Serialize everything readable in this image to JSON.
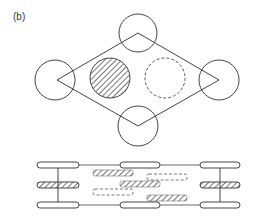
{
  "figure": {
    "panel_label": "(b)",
    "top_view": {
      "description": "rhombus with four corner circles, hatched circle and dashed circle inside",
      "corner_circles": 4,
      "inner_circles": [
        {
          "style": "hatched"
        },
        {
          "style": "dashed"
        }
      ]
    },
    "side_view": {
      "description": "three layers of rods with hatched and dashed bars between vertical frame lines",
      "layers": 3
    },
    "colors": {
      "stroke": "#444444",
      "dashed": "#555555",
      "hatch": "#555555"
    }
  }
}
